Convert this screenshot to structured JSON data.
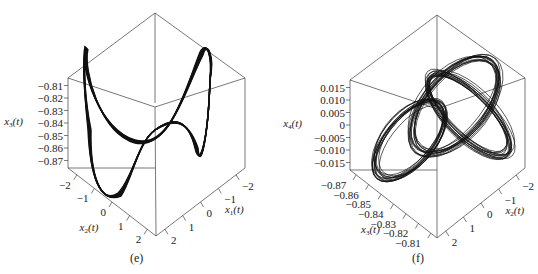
{
  "chart_data": [
    {
      "id": "e",
      "type": "line",
      "subtype": "3d-phase-portrait",
      "caption": "(e)",
      "axes": {
        "z": {
          "label": "x",
          "sub": "3",
          "arg": "(t)",
          "ticks": [
            "−0.81",
            "−0.82",
            "−0.83",
            "−0.84",
            "−0.85",
            "−0.86",
            "−0.87"
          ],
          "range": [
            -0.875,
            -0.805
          ]
        },
        "left": {
          "label": "x",
          "sub": "2",
          "arg": "(t)",
          "ticks": [
            "−2",
            "−1",
            "0",
            "1",
            "2"
          ],
          "range": [
            -2.5,
            2.5
          ]
        },
        "right": {
          "label": "x",
          "sub": "1",
          "arg": "(t)",
          "ticks": [
            "2",
            "1",
            "0",
            "−1",
            "−2"
          ],
          "range": [
            -2.5,
            2.5
          ]
        }
      },
      "description": "Double-scroll figure-eight attractor: two large lobes with peaks near upper-left and upper-right, and troughs near the lower middle"
    },
    {
      "id": "f",
      "type": "line",
      "subtype": "3d-phase-portrait",
      "caption": "(f)",
      "axes": {
        "z": {
          "label": "x",
          "sub": "4",
          "arg": "(t)",
          "ticks": [
            "0.015",
            "0.010",
            "0.005",
            "0",
            "−0.005",
            "−0.010",
            "−0.015"
          ],
          "range": [
            -0.018,
            0.018
          ]
        },
        "left": {
          "label": "x",
          "sub": "3",
          "arg": "(t)",
          "ticks": [
            "−0.87",
            "−0.86",
            "−0.85",
            "−0.84",
            "−0.83",
            "−0.82",
            "−0.81"
          ],
          "range": [
            -0.875,
            -0.805
          ]
        },
        "right": {
          "label": "x",
          "sub": "2",
          "arg": "(t)",
          "ticks": [
            "2",
            "1",
            "0",
            "−1",
            "−2"
          ],
          "range": [
            -2.5,
            2.5
          ]
        }
      },
      "description": "Three interlocking elliptical loop bundles (chaotic torus-like trajectory) arranged diagonally"
    }
  ]
}
